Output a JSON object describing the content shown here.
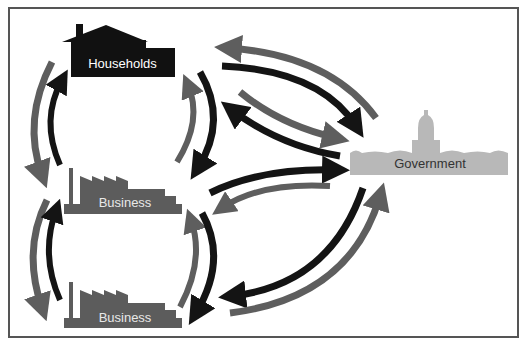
{
  "diagram": {
    "type": "circular-flow",
    "colors": {
      "households_fill": "#111111",
      "business_fill": "#5c5c5c",
      "government_fill": "#b8b8b8",
      "arrow_dark": "#141414",
      "arrow_gray": "#5e5e5e",
      "frame": "#555555"
    },
    "nodes": {
      "households": {
        "label": "Households",
        "icon": "house-icon"
      },
      "business_top": {
        "label": "Business",
        "icon": "factory-icon"
      },
      "business_bottom": {
        "label": "Business",
        "icon": "factory-icon"
      },
      "government": {
        "label": "Government",
        "icon": "capitol-icon"
      }
    },
    "edges": [
      {
        "from": "households",
        "to": "business_top",
        "color": "gray",
        "side": "left-outer"
      },
      {
        "from": "business_top",
        "to": "households",
        "color": "dark",
        "side": "left-inner"
      },
      {
        "from": "business_top",
        "to": "households",
        "color": "gray",
        "side": "right-inner"
      },
      {
        "from": "households",
        "to": "business_top",
        "color": "dark",
        "side": "right-outer"
      },
      {
        "from": "business_top",
        "to": "business_bottom",
        "color": "gray",
        "side": "left-outer"
      },
      {
        "from": "business_bottom",
        "to": "business_top",
        "color": "dark",
        "side": "left-inner"
      },
      {
        "from": "business_bottom",
        "to": "business_top",
        "color": "gray",
        "side": "right-inner"
      },
      {
        "from": "business_top",
        "to": "business_bottom",
        "color": "dark",
        "side": "right-outer"
      },
      {
        "from": "government",
        "to": "households",
        "color": "gray"
      },
      {
        "from": "households",
        "to": "government",
        "color": "dark"
      },
      {
        "from": "households",
        "to": "government",
        "color": "gray"
      },
      {
        "from": "government",
        "to": "households",
        "color": "dark"
      },
      {
        "from": "business_top",
        "to": "government",
        "color": "dark"
      },
      {
        "from": "government",
        "to": "business_top",
        "color": "gray"
      },
      {
        "from": "government",
        "to": "business_bottom",
        "color": "dark"
      },
      {
        "from": "business_bottom",
        "to": "government",
        "color": "gray"
      }
    ]
  }
}
